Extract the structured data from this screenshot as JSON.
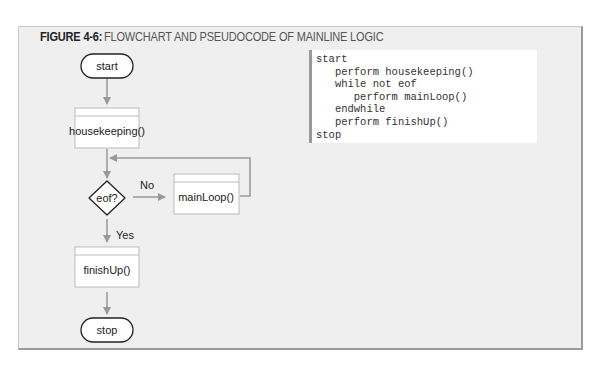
{
  "figure": {
    "label": "FIGURE 4-6:",
    "title": "FLOWCHART AND PSEUDOCODE OF MAINLINE LOGIC"
  },
  "flowchart": {
    "start_label": "start",
    "housekeeping_label": "housekeeping()",
    "decision_label": "eof?",
    "no_label": "No",
    "yes_label": "Yes",
    "mainloop_label": "mainLoop()",
    "finishup_label": "finishUp()",
    "stop_label": "stop"
  },
  "pseudocode": {
    "lines": [
      "start",
      "   perform housekeeping()",
      "   while not eof",
      "      perform mainLoop()",
      "   endwhile",
      "   perform finishUp()",
      "stop"
    ]
  },
  "colors": {
    "frame_bg": "#efefef",
    "box_border": "#bbbbbb",
    "arrow": "#999999",
    "terminal_border": "#222222"
  }
}
